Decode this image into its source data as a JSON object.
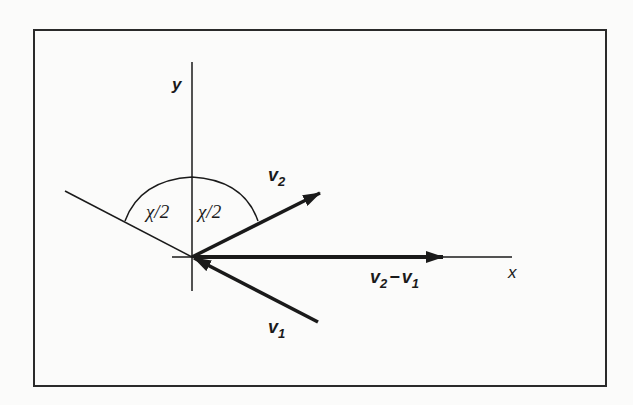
{
  "diagram": {
    "axes": {
      "x_label": "x",
      "y_label": "y"
    },
    "vectors": [
      {
        "id": "v2",
        "label_main": "v",
        "label_sub": "2"
      },
      {
        "id": "v1",
        "label_main": "v",
        "label_sub": "1"
      },
      {
        "id": "v2_minus_v1",
        "label_main1": "v",
        "label_sub1": "2",
        "label_op": "−",
        "label_main2": "v",
        "label_sub2": "1"
      }
    ],
    "angles": [
      {
        "id": "left-half-angle",
        "label": "χ/2"
      },
      {
        "id": "right-half-angle",
        "label": "χ/2"
      }
    ],
    "colors": {
      "ink": "#1a1a1a",
      "background": "#fbfbfa",
      "frame": "#2a2a2a"
    }
  }
}
